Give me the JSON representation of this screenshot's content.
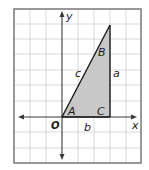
{
  "figure": {
    "type": "coordinate-plane-right-triangle",
    "frame": {
      "x": 14,
      "y": 9,
      "width": 127,
      "height": 154
    },
    "grid": {
      "vertical_lines": [
        30,
        46,
        78,
        94,
        126
      ],
      "horizontal_lines": [
        24,
        39,
        54,
        70,
        85,
        101,
        132,
        148
      ],
      "color": "#c9c9c9"
    },
    "axes": {
      "origin": {
        "x": 62,
        "y": 117
      },
      "x_label": "x",
      "y_label": "y",
      "origin_label": "O",
      "color": "#3a3a3a"
    },
    "triangle": {
      "vertices": {
        "A": {
          "x": 62,
          "y": 117
        },
        "C": {
          "x": 110,
          "y": 117
        },
        "B": {
          "x": 110,
          "y": 25
        }
      },
      "fill": "#c8c8c8",
      "stroke": "#1a1a1a",
      "vertex_labels": {
        "A": "A",
        "B": "B",
        "C": "C"
      },
      "side_labels": {
        "a": "a",
        "b": "b",
        "c": "c"
      }
    }
  }
}
